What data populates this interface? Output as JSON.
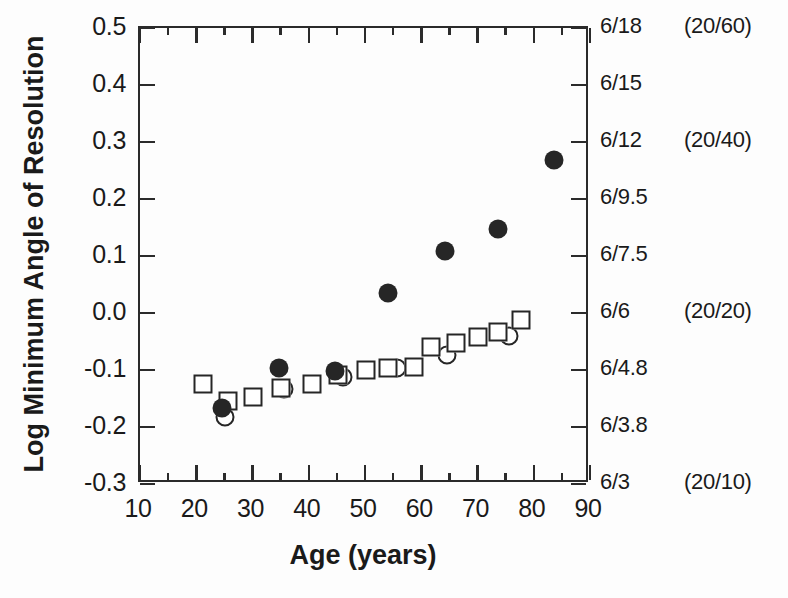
{
  "axes": {
    "y_title": "Log Minimum Angle of Resolution",
    "x_title": "Age  (years)",
    "y_ticks": [
      "0.5",
      "0.4",
      "0.3",
      "0.2",
      "0.1",
      "0.0",
      "-0.1",
      "-0.2",
      "-0.3"
    ],
    "x_ticks": [
      "10",
      "20",
      "30",
      "40",
      "50",
      "60",
      "70",
      "80",
      "90"
    ],
    "right_snellen": [
      "6/18",
      "6/15",
      "6/12",
      "6/9.5",
      "6/7.5",
      "6/6",
      "6/4.8",
      "6/3.8",
      "6/3"
    ],
    "right_us": [
      "(20/60)",
      "",
      "(20/40)",
      "",
      "",
      "(20/20)",
      "",
      "",
      "(20/10)"
    ]
  },
  "chart_data": {
    "type": "scatter",
    "title": "",
    "xlabel": "Age  (years)",
    "ylabel": "Log Minimum Angle of Resolution",
    "xlim": [
      10,
      90
    ],
    "ylim": [
      -0.3,
      0.5
    ],
    "grid": false,
    "legend": "none",
    "y_axis_ticks": [
      0.5,
      0.4,
      0.3,
      0.2,
      0.1,
      0.0,
      -0.1,
      -0.2,
      -0.3
    ],
    "x_axis_ticks": [
      10,
      20,
      30,
      40,
      50,
      60,
      70,
      80,
      90
    ],
    "x_axis_minor_ticks": [
      15,
      25,
      35,
      45,
      55,
      65,
      75,
      85
    ],
    "secondary_y_axis": {
      "label": "Snellen acuity (metric) with US equivalent",
      "ticks": [
        {
          "y": 0.5,
          "snellen": "6/18",
          "us": "(20/60)"
        },
        {
          "y": 0.4,
          "snellen": "6/15",
          "us": ""
        },
        {
          "y": 0.3,
          "snellen": "6/12",
          "us": "(20/40)"
        },
        {
          "y": 0.2,
          "snellen": "6/9.5",
          "us": ""
        },
        {
          "y": 0.1,
          "snellen": "6/7.5",
          "us": ""
        },
        {
          "y": 0.0,
          "snellen": "6/6",
          "us": "(20/20)"
        },
        {
          "y": -0.1,
          "snellen": "6/4.8",
          "us": ""
        },
        {
          "y": -0.2,
          "snellen": "6/3.8",
          "us": ""
        },
        {
          "y": -0.3,
          "snellen": "6/3",
          "us": "(20/10)"
        }
      ]
    },
    "series": [
      {
        "name": "filled-circle",
        "marker": "filled circle",
        "points": [
          {
            "x": 25,
            "y": -0.17
          },
          {
            "x": 35,
            "y": -0.1
          },
          {
            "x": 45,
            "y": -0.105
          },
          {
            "x": 54.5,
            "y": 0.032
          },
          {
            "x": 64.5,
            "y": 0.105
          },
          {
            "x": 74,
            "y": 0.143
          },
          {
            "x": 84,
            "y": 0.265
          }
        ]
      },
      {
        "name": "open-square",
        "marker": "open square",
        "points": [
          {
            "x": 21.5,
            "y": -0.128
          },
          {
            "x": 26,
            "y": -0.158
          },
          {
            "x": 30.5,
            "y": -0.15
          },
          {
            "x": 35.5,
            "y": -0.135
          },
          {
            "x": 41,
            "y": -0.128
          },
          {
            "x": 45.5,
            "y": -0.113
          },
          {
            "x": 50.5,
            "y": -0.104
          },
          {
            "x": 54.5,
            "y": -0.1
          },
          {
            "x": 59,
            "y": -0.098
          },
          {
            "x": 62,
            "y": -0.064
          },
          {
            "x": 66.5,
            "y": -0.057
          },
          {
            "x": 70.5,
            "y": -0.046
          },
          {
            "x": 74,
            "y": -0.037
          },
          {
            "x": 78,
            "y": -0.015
          }
        ]
      },
      {
        "name": "open-circle",
        "marker": "open circle",
        "points": [
          {
            "x": 25.5,
            "y": -0.186
          },
          {
            "x": 36,
            "y": -0.137
          },
          {
            "x": 46.5,
            "y": -0.115
          },
          {
            "x": 56,
            "y": -0.1
          },
          {
            "x": 65,
            "y": -0.078
          },
          {
            "x": 76,
            "y": -0.044
          }
        ]
      }
    ]
  }
}
